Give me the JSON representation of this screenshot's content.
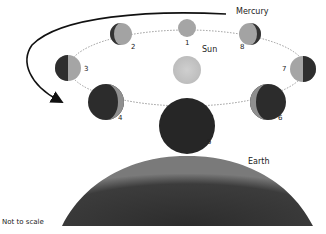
{
  "diagram": {
    "title_label": "Mercury",
    "sun_label": "Sun",
    "earth_label": "Earth",
    "scale_note": "Not to scale",
    "phases": [
      {
        "n": "1",
        "cx": 187,
        "cy": 28,
        "r": 9,
        "lit": "full"
      },
      {
        "n": "2",
        "cx": 121,
        "cy": 34,
        "r": 11,
        "lit": "gibbous-right"
      },
      {
        "n": "3",
        "cx": 68,
        "cy": 68,
        "r": 13,
        "lit": "half-right"
      },
      {
        "n": "4",
        "cx": 106,
        "cy": 102,
        "r": 18,
        "lit": "crescent-right"
      },
      {
        "n": "5",
        "cx": 187,
        "cy": 126,
        "r": 28,
        "lit": "new"
      },
      {
        "n": "6",
        "cx": 268,
        "cy": 102,
        "r": 18,
        "lit": "crescent-left"
      },
      {
        "n": "7",
        "cx": 303,
        "cy": 69,
        "r": 13,
        "lit": "half-left"
      },
      {
        "n": "8",
        "cx": 250,
        "cy": 34,
        "r": 11,
        "lit": "gibbous-left"
      }
    ],
    "colors": {
      "lit": "#a8a8a8",
      "dark": "#2a2a2a",
      "sun": "#c4c4c4",
      "earth": "#3a3a3a",
      "orbit": "#999999",
      "arrow": "#111111"
    }
  }
}
